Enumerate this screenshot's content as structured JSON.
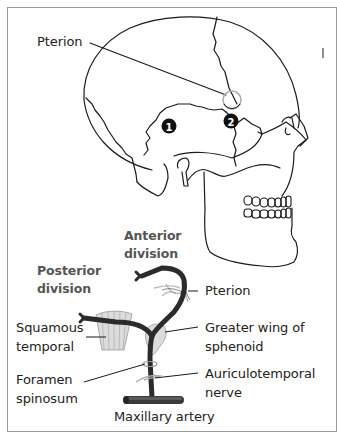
{
  "figure": {
    "top_panel": {
      "title": "Lateral view of skull",
      "labels": {
        "pterion": "Pterion"
      },
      "markers": [
        {
          "id": "1",
          "label": "1"
        },
        {
          "id": "2",
          "label": "2"
        }
      ]
    },
    "bottom_panel": {
      "labels": {
        "anterior_division": [
          "Anterior",
          "division"
        ],
        "posterior_division": [
          "Posterior",
          "division"
        ],
        "pterion": "Pterion",
        "squamous_temporal": [
          "Squamous",
          "temporal"
        ],
        "greater_wing": [
          "Greater wing of",
          "sphenoid"
        ],
        "foramen_spinosum": [
          "Foramen",
          "spinosum"
        ],
        "auriculotemporal_nerve": [
          "Auriculotemporal",
          "nerve"
        ],
        "maxillary_artery": "Maxillary artery"
      }
    },
    "colors": {
      "outline": "#1a1a1a",
      "frame": "#9a9a9a",
      "artery": "#2b2b2b",
      "bone_fill": "#dcdcdc",
      "pterion_ring": "#aaaaaa",
      "division_label": "#555555",
      "label": "#222222"
    }
  }
}
